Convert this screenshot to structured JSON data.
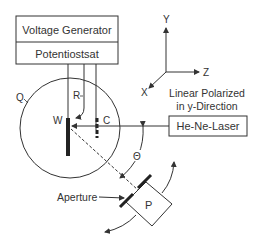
{
  "diagram": {
    "instruments": {
      "top_label": "Voltage Generator",
      "bottom_label": "Potentiostsat"
    },
    "axes": {
      "y": "Y",
      "z": "Z",
      "x": "X"
    },
    "cell": {
      "label": "Q",
      "reference_electrode": "R",
      "working_electrode": "W",
      "counter_electrode": "C"
    },
    "laser": {
      "caption_line1": "Linear Polarized",
      "caption_line2": "in y-Direction",
      "label": "He-Ne-Laser"
    },
    "angle_label": "Θ",
    "aperture_label": "Aperture",
    "polarizer_label": "P",
    "colors": {
      "line": "#333333",
      "background": "#ffffff"
    }
  }
}
